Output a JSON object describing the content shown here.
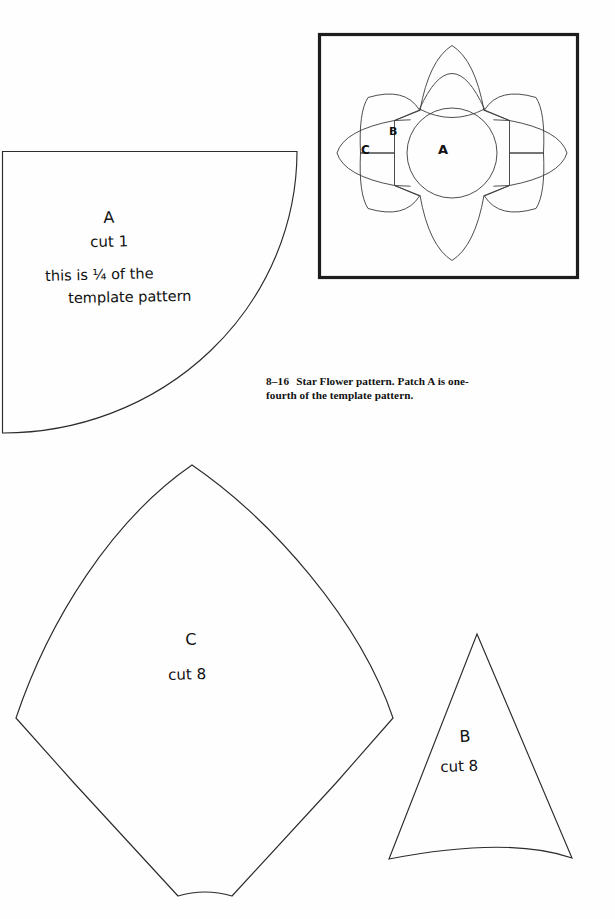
{
  "page": {
    "background": "#fefefe",
    "ink": "#1a1a1a",
    "width": 615,
    "height": 919
  },
  "figure": {
    "caption_number": "8–16",
    "caption_text": "Star Flower pattern. Patch A is one-fourth of the template pattern.",
    "caption_line1": "Star Flower pattern. Patch A is one-",
    "caption_line2": "fourth of the template pattern.",
    "frame_color": "#1d1d1d",
    "labels": {
      "center": "A",
      "wedge": "B",
      "petal": "C"
    }
  },
  "patches": [
    {
      "id": "A",
      "label": "A",
      "cut": "cut 1",
      "note_line1": "this is ¼ of the",
      "note_line2": "template pattern",
      "shape": "quarter-circle"
    },
    {
      "id": "C",
      "label": "C",
      "cut": "cut 8",
      "shape": "pointed-kite-petal"
    },
    {
      "id": "B",
      "label": "B",
      "cut": "cut 8",
      "shape": "narrow-triangle-concave-base"
    }
  ],
  "handwriting": {
    "a_label": "A",
    "a_cut": "cut 1",
    "a_note_1": "this is ¼ of the",
    "a_note_2": "template pattern",
    "c_label": "C",
    "c_cut": "cut 8",
    "b_label": "B",
    "b_cut": "cut 8"
  }
}
